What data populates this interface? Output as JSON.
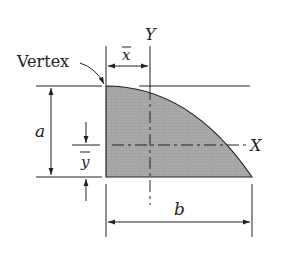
{
  "figure": {
    "labels": {
      "vertex": "Vertex",
      "y_axis": "Y",
      "x_axis": "X",
      "x_bar": "x",
      "y_bar": "y",
      "height": "a",
      "width": "b"
    },
    "colors": {
      "fill": "#a8a8a8",
      "stroke": "#222222",
      "background": "#ffffff"
    }
  }
}
